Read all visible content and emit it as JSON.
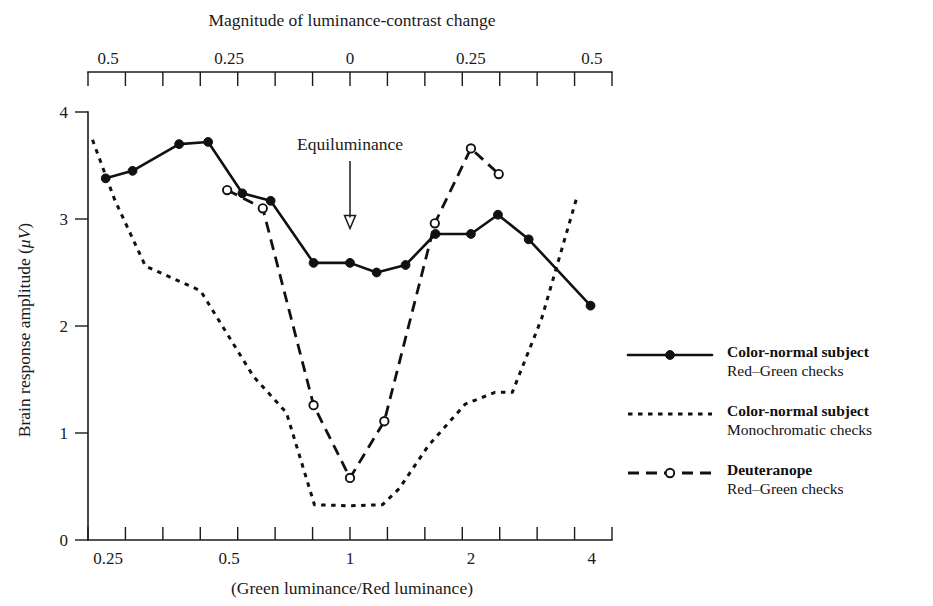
{
  "chart_data": {
    "type": "line",
    "title": "",
    "top_axis": {
      "label": "Magnitude of luminance-contrast change",
      "tick_labels": [
        "0.5",
        "0.25",
        "0",
        "0.25",
        "0.5"
      ],
      "tick_label_positions": [
        0.25,
        0.5,
        1,
        2,
        4
      ],
      "minor_ticks": 13
    },
    "xlabel": "(Green luminance/Red luminance)",
    "x_tick_labels": [
      "0.25",
      "0.5",
      "1",
      "2",
      "4"
    ],
    "x_tick_values": [
      0.25,
      0.5,
      1,
      2,
      4
    ],
    "xlim": [
      0.2227,
      4.49
    ],
    "xscale": "log2",
    "ylabel": "Brain response amplitude (μV)",
    "ylabel_plain": "Brain response amplitude",
    "ylabel_units": "μV",
    "y_tick_labels": [
      "0",
      "1",
      "2",
      "3",
      "4"
    ],
    "y_tick_values": [
      0,
      1,
      2,
      3,
      4
    ],
    "ylim": [
      0,
      4
    ],
    "grid": false,
    "legend_position": "right",
    "annotations": [
      {
        "text": "Equiluminance",
        "x": 1.0,
        "y": 3.72,
        "arrow_to_y": 2.92
      }
    ],
    "series": [
      {
        "name": "Color-normal subject",
        "sub": "Red–Green checks",
        "style": "solid",
        "marker": "filled-circle",
        "x": [
          0.2465,
          0.2875,
          0.3755,
          0.4435,
          0.5395,
          0.6345,
          0.8115,
          1.0,
          1.165,
          1.375,
          1.6325,
          2.0,
          2.335,
          2.785,
          3.97
        ],
        "y": [
          3.38,
          3.45,
          3.7,
          3.72,
          3.24,
          3.17,
          2.59,
          2.59,
          2.5,
          2.57,
          2.86,
          2.86,
          3.04,
          2.81,
          2.19
        ]
      },
      {
        "name": "Color-normal subject",
        "sub": "Monochromatic checks",
        "style": "dotted",
        "marker": "none",
        "x": [
          0.2285,
          0.2595,
          0.3095,
          0.4245,
          0.5745,
          0.6945,
          0.8155,
          1.0,
          1.205,
          1.3255,
          1.5655,
          1.9355,
          2.2955,
          2.5355,
          3.0,
          3.6755
        ],
        "y": [
          3.74,
          3.18,
          2.56,
          2.33,
          1.53,
          1.19,
          0.33,
          0.32,
          0.33,
          0.48,
          0.88,
          1.27,
          1.38,
          1.38,
          2.07,
          3.21
        ]
      },
      {
        "name": "Deuteranope",
        "sub": "Red–Green checks",
        "style": "dashed",
        "marker": "open-circle",
        "x": [
          0.4945,
          0.6065,
          0.8115,
          1.0,
          1.2175,
          1.626,
          2.0,
          2.3455
        ],
        "y": [
          3.27,
          3.1,
          1.26,
          0.58,
          1.11,
          2.96,
          3.66,
          3.42
        ]
      }
    ]
  },
  "legend": {
    "entries": [
      {
        "title": "Color-normal subject",
        "subtitle": "Red–Green checks",
        "style": "solid",
        "marker": "filled-circle"
      },
      {
        "title": "Color-normal subject",
        "subtitle": "Monochromatic checks",
        "style": "dotted",
        "marker": "none"
      },
      {
        "title": "Deuteranope",
        "subtitle": "Red–Green checks",
        "style": "dashed",
        "marker": "open-circle"
      }
    ]
  }
}
